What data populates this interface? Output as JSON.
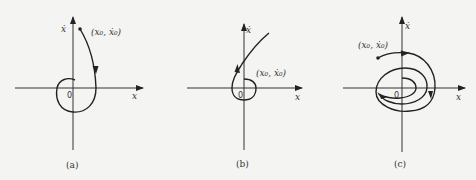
{
  "figure": {
    "panels": [
      {
        "id": "a",
        "caption": "(a)",
        "x_axis_label": "x",
        "y_axis_label": "ẋ",
        "origin_label": "0",
        "start_point_label": "(x₀, ẋ₀)",
        "description": "Trajectory starting at (x0, x0dot) in upper half-plane, spiraling clockwise inward toward origin"
      },
      {
        "id": "b",
        "caption": "(b)",
        "x_axis_label": "x",
        "y_axis_label": "ẋ",
        "origin_label": "0",
        "start_point_label": "(x₀, ẋ₀)",
        "description": "Trajectory starting near origin, spiraling outward and diverging to upper right"
      },
      {
        "id": "c",
        "caption": "(c)",
        "x_axis_label": "x",
        "y_axis_label": "ẋ",
        "origin_label": "0",
        "start_point_label": "(x₀, ẋ₀)",
        "description": "Trajectory starting in upper-left, spiraling clockwise inward in multiple loops"
      }
    ]
  }
}
